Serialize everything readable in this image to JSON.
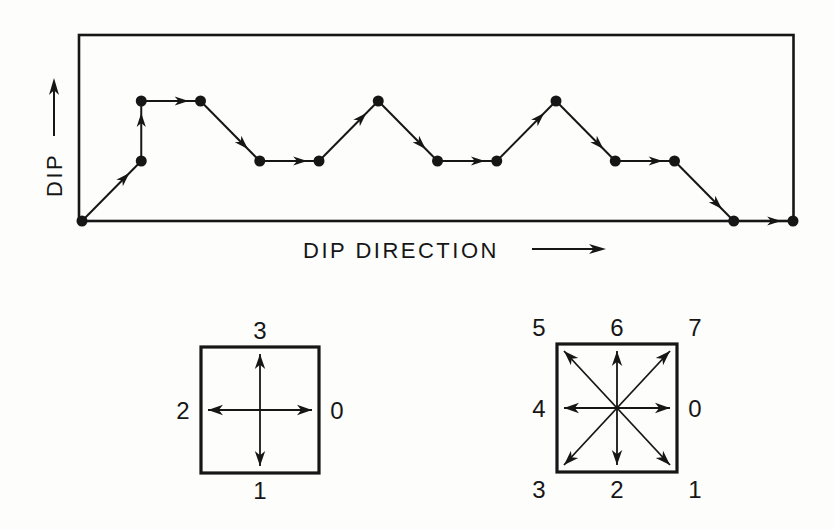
{
  "figure": {
    "background_color": "#fdfdfc",
    "ink_color": "#161616"
  },
  "chart_data": {
    "type": "line",
    "title": "",
    "xlabel": "DIP DIRECTION",
    "ylabel": "DIP",
    "x": [
      0,
      1,
      1,
      2,
      3,
      4,
      5,
      6,
      7,
      8,
      9,
      10,
      11,
      12
    ],
    "y": [
      0,
      1,
      2,
      2,
      1,
      1,
      2,
      1,
      1,
      2,
      1,
      1,
      0,
      0
    ],
    "xlim": [
      0,
      12
    ],
    "ylim": [
      0,
      2
    ],
    "grid": false,
    "legend_position": "none",
    "markers": "filled-circle",
    "segment_arrows": true,
    "chain_code_8dir": [
      7,
      6,
      0,
      1,
      0,
      7,
      1,
      0,
      7,
      1,
      0,
      1,
      0
    ]
  },
  "code_keys": {
    "four_direction": {
      "labels": [
        {
          "value": "0",
          "direction": "E"
        },
        {
          "value": "1",
          "direction": "S"
        },
        {
          "value": "2",
          "direction": "W"
        },
        {
          "value": "3",
          "direction": "N"
        }
      ]
    },
    "eight_direction": {
      "labels": [
        {
          "value": "0",
          "direction": "E"
        },
        {
          "value": "1",
          "direction": "SE"
        },
        {
          "value": "2",
          "direction": "S"
        },
        {
          "value": "3",
          "direction": "SW"
        },
        {
          "value": "4",
          "direction": "W"
        },
        {
          "value": "5",
          "direction": "NW"
        },
        {
          "value": "6",
          "direction": "N"
        },
        {
          "value": "7",
          "direction": "NE"
        }
      ]
    }
  }
}
